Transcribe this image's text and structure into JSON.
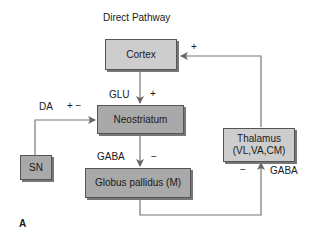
{
  "title": "Direct Pathway",
  "nodes": {
    "cortex": "Cortex",
    "neostriatum": "Neostriatum",
    "sn": "SN",
    "globus_pallidus": "Globus pallidus (M)",
    "thalamus_line1": "Thalamus",
    "thalamus_line2": "(VL,VA,CM)"
  },
  "edges": {
    "cortex_to_neostriatum": {
      "transmitter": "GLU",
      "sign": "+"
    },
    "sn_to_neostriatum": {
      "transmitter": "DA",
      "sign": "+ −"
    },
    "neostriatum_to_gp": {
      "transmitter": "GABA",
      "sign": "−"
    },
    "gp_to_thalamus": {
      "transmitter": "GABA",
      "sign": "−"
    },
    "thalamus_to_cortex": {
      "sign": "+"
    }
  },
  "panel_label": "A",
  "colors": {
    "light_box": "#cdcdcd",
    "dark_box": "#a9a9a9",
    "line": "#666666"
  }
}
